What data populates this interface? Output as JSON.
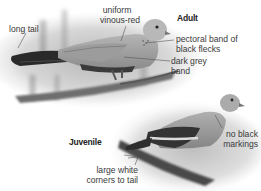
{
  "figure": {
    "adult": {
      "title": "Adult",
      "labels": {
        "long_tail": "long tail",
        "uniform_line1": "uniform",
        "uniform_line2": "vinous-red",
        "pectoral_line1": "pectoral band of",
        "pectoral_line2": "black flecks",
        "dark_grey_line1": "dark grey",
        "dark_grey_line2": "band"
      }
    },
    "juvenile": {
      "title": "Juvenile",
      "labels": {
        "no_black_line1": "no black",
        "no_black_line2": "markings",
        "white_corners_line1": "large white",
        "white_corners_line2": "corners to tail"
      }
    }
  },
  "colors": {
    "background": "#ffffff",
    "text": "#3a3a3a",
    "leader_line": "#555555"
  }
}
